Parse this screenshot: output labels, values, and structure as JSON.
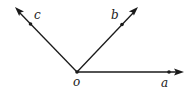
{
  "diagram": {
    "type": "rays-from-common-origin",
    "origin": {
      "label": "o"
    },
    "rays": [
      {
        "id": "a",
        "label": "a",
        "direction": "right"
      },
      {
        "id": "b",
        "label": "b",
        "direction": "upper-right"
      },
      {
        "id": "c",
        "label": "c",
        "direction": "upper-left"
      }
    ],
    "colors": {
      "stroke": "#1a1a1a",
      "background": "#ffffff"
    }
  }
}
